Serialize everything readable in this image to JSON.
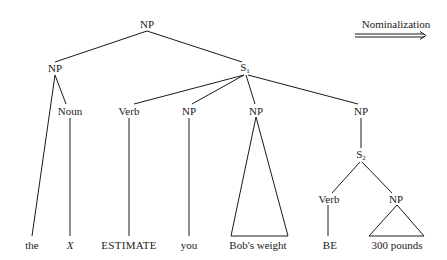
{
  "transformation": {
    "label": "Nominalization",
    "arrow": "double-right-arrow"
  },
  "tree": {
    "root": {
      "label": "NP",
      "x": 147,
      "y": 24
    },
    "nodes": [
      {
        "id": "np-left",
        "label": "NP",
        "sub": "",
        "x": 55,
        "y": 68
      },
      {
        "id": "s1",
        "label": "S",
        "sub": "1",
        "x": 245,
        "y": 68
      },
      {
        "id": "noun",
        "label": "Noun",
        "sub": "",
        "x": 70,
        "y": 111
      },
      {
        "id": "verb1",
        "label": "Verb",
        "sub": "",
        "x": 129,
        "y": 111
      },
      {
        "id": "np-you",
        "label": "NP",
        "sub": "",
        "x": 189,
        "y": 111
      },
      {
        "id": "np-bob",
        "label": "NP",
        "sub": "",
        "x": 256,
        "y": 111
      },
      {
        "id": "np-right",
        "label": "NP",
        "sub": "",
        "x": 361,
        "y": 111
      },
      {
        "id": "s2",
        "label": "S",
        "sub": "2",
        "x": 361,
        "y": 155
      },
      {
        "id": "verb2",
        "label": "Verb",
        "sub": "",
        "x": 329,
        "y": 199
      },
      {
        "id": "np-pounds",
        "label": "NP",
        "sub": "",
        "x": 396,
        "y": 199
      }
    ],
    "leaves": [
      {
        "id": "leaf-the",
        "text": "the",
        "x": 32,
        "y": 245,
        "style": "normal"
      },
      {
        "id": "leaf-x",
        "text": "X",
        "x": 70,
        "y": 245,
        "style": "italic"
      },
      {
        "id": "leaf-estimate",
        "text": "ESTIMATE",
        "x": 129,
        "y": 245,
        "style": "caps"
      },
      {
        "id": "leaf-you",
        "text": "you",
        "x": 189,
        "y": 245,
        "style": "normal"
      },
      {
        "id": "leaf-bobs-weight",
        "text": "Bob's weight",
        "x": 256,
        "y": 245,
        "style": "normal"
      },
      {
        "id": "leaf-be",
        "text": "BE",
        "x": 331,
        "y": 245,
        "style": "caps"
      },
      {
        "id": "leaf-300-pounds",
        "text": "300 pounds",
        "x": 396,
        "y": 245,
        "style": "normal"
      }
    ],
    "line_color": "#1a1a1a"
  }
}
